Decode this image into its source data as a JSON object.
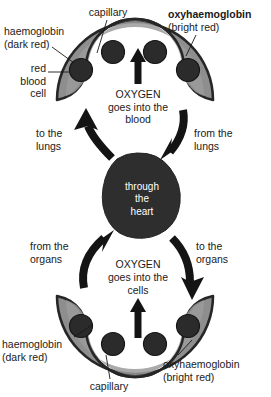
{
  "diagram": {
    "colors": {
      "background": "#ffffff",
      "text": "#1a1a1a",
      "vessel_outline": "#262626",
      "vessel_fill": "#8e8e8e",
      "vessel_fill_light": "#a8a8a8",
      "blood_cell": "#2b2b2b",
      "heart_fill": "#2e2e2e",
      "arrow": "#1a1a1a",
      "leader_line": "#1a1a1a"
    },
    "top_vessel": {
      "label_capillary": "capillary",
      "label_haemoglobin": "haemoglobin\n(dark red)",
      "label_red_blood_cell": "red\nblood\ncell",
      "label_oxyhaemoglobin_bold": "oxyhaemoglobin",
      "label_oxyhaemoglobin_sub": "(bright red)",
      "center_text_line1": "OXYGEN",
      "center_text_line2": "goes into the",
      "center_text_line3": "blood",
      "blood_cell_count": 4
    },
    "bottom_vessel": {
      "label_capillary": "capillary",
      "label_haemoglobin": "haemoglobin\n(dark red)",
      "label_oxyhaemoglobin": "oxyhaemoglobin",
      "label_oxyhaemoglobin_sub": "(bright red)",
      "center_text_line1": "OXYGEN",
      "center_text_line2": "goes into the",
      "center_text_line3": "cells",
      "blood_cell_count": 4
    },
    "heart": {
      "line1": "through",
      "line2": "the",
      "line3": "heart"
    },
    "arrows": [
      {
        "name": "to-the-lungs",
        "label": "to the\nlungs",
        "direction": "up-left"
      },
      {
        "name": "from-the-lungs",
        "label": "from the\nlungs",
        "direction": "down-left"
      },
      {
        "name": "from-the-organs",
        "label": "from the\norgans",
        "direction": "up-right"
      },
      {
        "name": "to-the-organs",
        "label": "to the\norgans",
        "direction": "down-right"
      }
    ]
  }
}
